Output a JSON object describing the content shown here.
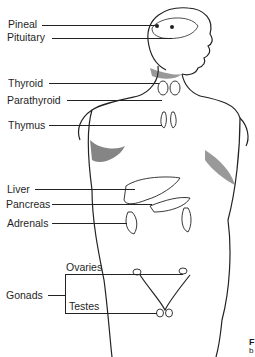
{
  "diagram": {
    "labels": {
      "pineal": "Pineal",
      "pituitary": "Pituitary",
      "thyroid": "Thyroid",
      "parathyroid": "Parathyroid",
      "thymus": "Thymus",
      "liver": "Liver",
      "pancreas": "Pancreas",
      "adrenals": "Adrenals",
      "gonads": "Gonads",
      "ovaries": "Ovaries",
      "testes": "Testes"
    },
    "caption_fragment": {
      "line1": "F",
      "line2": "b"
    },
    "colors": {
      "ink": "#1f1f1f",
      "background": "#ffffff"
    }
  }
}
